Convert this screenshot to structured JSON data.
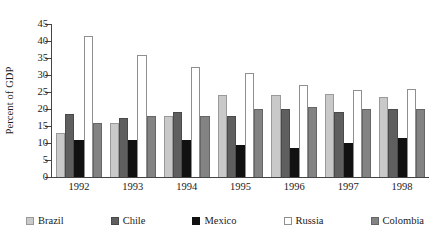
{
  "chart_data": {
    "type": "bar",
    "title": "",
    "xlabel": "",
    "ylabel": "Percent of GDP",
    "ylim": [
      0,
      45
    ],
    "ytick_step": 5,
    "yticks": [
      0,
      5,
      10,
      15,
      20,
      25,
      30,
      35,
      40,
      45
    ],
    "grid": false,
    "legend_position": "bottom",
    "categories": [
      "1992",
      "1993",
      "1994",
      "1995",
      "1996",
      "1997",
      "1998"
    ],
    "series": [
      {
        "name": "Brazil",
        "color": "#c9c9c9",
        "values": [
          13,
          16,
          18,
          24,
          24,
          24.5,
          23.5
        ]
      },
      {
        "name": "Chile",
        "color": "#5f5f5f",
        "values": [
          18.5,
          17.5,
          19,
          18,
          20,
          19,
          20
        ]
      },
      {
        "name": "Mexico",
        "color": "#111111",
        "values": [
          11,
          11,
          11,
          9.5,
          8.5,
          10,
          11.5
        ]
      },
      {
        "name": "Russia",
        "color": "#ffffff",
        "values": [
          41.5,
          36,
          32.5,
          30.5,
          27,
          25.5,
          26
        ]
      },
      {
        "name": "Colombia",
        "color": "#838383",
        "values": [
          16,
          18,
          18,
          20,
          20.5,
          20,
          20
        ]
      }
    ]
  }
}
